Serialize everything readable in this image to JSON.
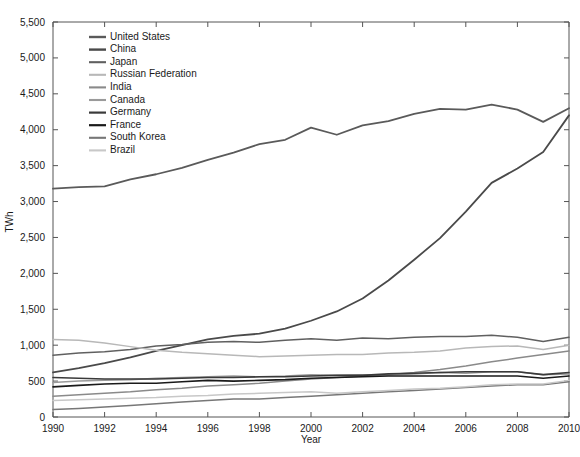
{
  "chart_data": {
    "type": "line",
    "title": "",
    "xlabel": "Year",
    "ylabel": "TWh",
    "xlim": [
      1990,
      2010
    ],
    "ylim": [
      0,
      5500
    ],
    "ytick_step": 500,
    "xtick_step": 2,
    "grid": false,
    "legend_position": "top-left",
    "xticks": [
      "1990",
      "1992",
      "1994",
      "1996",
      "1998",
      "2000",
      "2002",
      "2004",
      "2006",
      "2008",
      "2010"
    ],
    "yticks": [
      "0",
      "500",
      "1,000",
      "1,500",
      "2,000",
      "2,500",
      "3,000",
      "3,500",
      "4,000",
      "4,500",
      "5,000",
      "5,500"
    ],
    "x": [
      1990,
      1991,
      1992,
      1993,
      1994,
      1995,
      1996,
      1997,
      1998,
      1999,
      2000,
      2001,
      2002,
      2003,
      2004,
      2005,
      2006,
      2007,
      2008,
      2009,
      2010
    ],
    "series": [
      {
        "name": "United States",
        "color": "#5a5a5a",
        "width": 1.8,
        "values": [
          3180,
          3200,
          3210,
          3310,
          3380,
          3470,
          3580,
          3680,
          3800,
          3860,
          4030,
          3930,
          4060,
          4120,
          4220,
          4290,
          4280,
          4350,
          4280,
          4110,
          4300
        ]
      },
      {
        "name": "China",
        "color": "#4a4a4a",
        "width": 1.8,
        "values": [
          620,
          680,
          750,
          830,
          920,
          1000,
          1080,
          1130,
          1160,
          1230,
          1340,
          1470,
          1650,
          1900,
          2190,
          2490,
          2860,
          3260,
          3460,
          3690,
          4200
        ]
      },
      {
        "name": "Japan",
        "color": "#606060",
        "width": 1.5,
        "values": [
          860,
          890,
          910,
          940,
          990,
          1010,
          1040,
          1050,
          1040,
          1070,
          1090,
          1070,
          1100,
          1090,
          1110,
          1120,
          1120,
          1140,
          1110,
          1050,
          1110
        ]
      },
      {
        "name": "Russian Federation",
        "color": "#b8b8b8",
        "width": 1.5,
        "values": [
          1080,
          1070,
          1030,
          980,
          930,
          900,
          880,
          860,
          840,
          850,
          860,
          870,
          870,
          890,
          900,
          920,
          960,
          980,
          990,
          940,
          1000
        ]
      },
      {
        "name": "India",
        "color": "#8a8a8a",
        "width": 1.5,
        "values": [
          290,
          310,
          330,
          350,
          380,
          400,
          430,
          450,
          470,
          500,
          530,
          550,
          570,
          590,
          620,
          660,
          710,
          770,
          820,
          870,
          920
        ]
      },
      {
        "name": "Canada",
        "color": "#9a9a9a",
        "width": 1.5,
        "values": [
          480,
          500,
          510,
          520,
          540,
          550,
          560,
          570,
          560,
          570,
          590,
          580,
          590,
          590,
          600,
          620,
          610,
          630,
          630,
          590,
          600
        ]
      },
      {
        "name": "Germany",
        "color": "#3a3a3a",
        "width": 1.6,
        "values": [
          550,
          540,
          530,
          530,
          530,
          540,
          550,
          550,
          560,
          560,
          570,
          580,
          580,
          600,
          610,
          620,
          630,
          630,
          630,
          590,
          620
        ]
      },
      {
        "name": "France",
        "color": "#1a1a1a",
        "width": 1.6,
        "values": [
          420,
          440,
          460,
          470,
          470,
          490,
          510,
          500,
          510,
          520,
          540,
          550,
          560,
          570,
          570,
          570,
          570,
          570,
          570,
          540,
          570
        ]
      },
      {
        "name": "South Korea",
        "color": "#777777",
        "width": 1.5,
        "values": [
          105,
          120,
          140,
          160,
          185,
          210,
          230,
          250,
          250,
          270,
          290,
          310,
          330,
          350,
          370,
          390,
          410,
          430,
          450,
          450,
          490
        ]
      },
      {
        "name": "Brazil",
        "color": "#c8c8c8",
        "width": 1.5,
        "values": [
          230,
          240,
          250,
          260,
          270,
          290,
          300,
          320,
          330,
          340,
          350,
          330,
          350,
          370,
          390,
          400,
          420,
          450,
          460,
          460,
          510
        ]
      }
    ]
  }
}
